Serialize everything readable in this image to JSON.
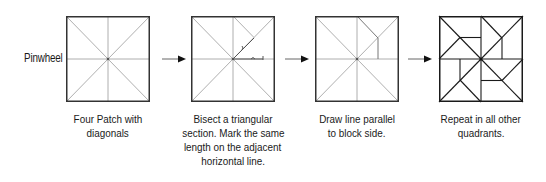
{
  "diagram": {
    "row_label": "Pinwheel",
    "steps": [
      {
        "id": "step-1",
        "caption_lines": [
          "Four Patch with",
          "diagonals"
        ],
        "icon": "four-patch-diagonals-block"
      },
      {
        "id": "step-2",
        "caption_lines": [
          "Bisect a triangular",
          "section. Mark the same",
          "length on the adjacent",
          "horizontal line."
        ],
        "icon": "bisect-triangle-block"
      },
      {
        "id": "step-3",
        "caption_lines": [
          "Draw line parallel",
          "to block side."
        ],
        "icon": "parallel-line-block"
      },
      {
        "id": "step-4",
        "caption_lines": [
          "Repeat in all other",
          "quadrants."
        ],
        "icon": "pinwheel-block"
      }
    ],
    "arrows": [
      {
        "from": "step-1",
        "to": "step-2",
        "icon": "arrow-right-icon"
      },
      {
        "from": "step-2",
        "to": "step-3",
        "icon": "arrow-right-icon"
      },
      {
        "from": "step-3",
        "to": "step-4",
        "icon": "arrow-right-icon"
      }
    ],
    "colors": {
      "outline": "#333333",
      "guide_lines": "#9a9a9a",
      "construction_lines": "#555555",
      "final_lines": "#1a1a1a"
    }
  }
}
